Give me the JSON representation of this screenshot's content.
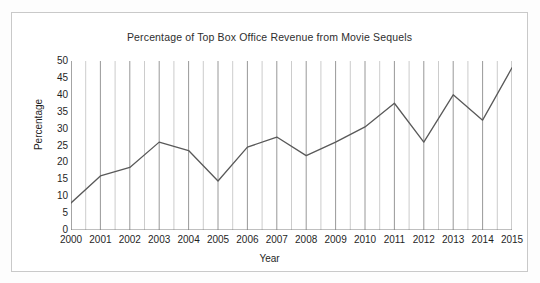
{
  "chart_data": {
    "type": "line",
    "title": "Percentage of Top Box Office Revenue from Movie Sequels",
    "xlabel": "Year",
    "ylabel": "Percentage",
    "categories": [
      "2000",
      "2001",
      "2002",
      "2003",
      "2004",
      "2005",
      "2006",
      "2007",
      "2008",
      "2009",
      "2010",
      "2011",
      "2012",
      "2013",
      "2014",
      "2015"
    ],
    "values": [
      8,
      16,
      18.5,
      26,
      23.5,
      14.5,
      24.5,
      27.5,
      22,
      26,
      30.5,
      37.5,
      26,
      40,
      32.5,
      48
    ],
    "series": [
      {
        "name": "Percentage of Top Box Office Revenue from Movie Sequels",
        "values": [
          8,
          16,
          18.5,
          26,
          23.5,
          14.5,
          24.5,
          27.5,
          22,
          26,
          30.5,
          37.5,
          26,
          40,
          32.5,
          48
        ]
      }
    ],
    "ylim": [
      0,
      50
    ],
    "y_ticks": [
      "50",
      "45",
      "40",
      "35",
      "30",
      "25",
      "20",
      "15",
      "10",
      "5",
      "0"
    ],
    "y_tick_values": [
      50,
      45,
      40,
      35,
      30,
      25,
      20,
      15,
      10,
      5,
      0
    ],
    "grid": "vertical",
    "legend": "none",
    "line_color": "#595959",
    "grid_color": "#8c8c8c",
    "axis_color": "#7f7f7f",
    "frame_color": "#c9c9c9",
    "text_color": "#1f1f1f"
  }
}
